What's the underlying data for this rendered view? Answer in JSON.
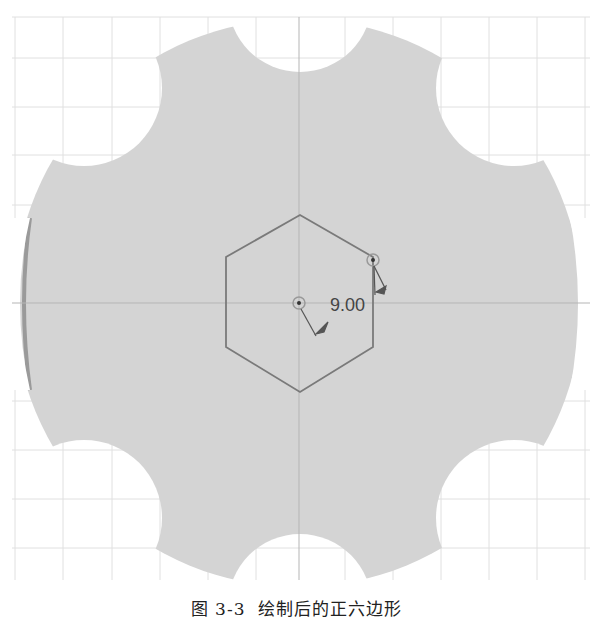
{
  "figure": {
    "caption": "图 3-3  绘制后的正六边形",
    "caption_clipped": true
  },
  "sketch": {
    "dimension_label": "9.00",
    "shape": "disc with 8 arc notches (gear-like plate)",
    "inner_shape": "regular hexagon",
    "colors": {
      "background": "#ffffff",
      "grid": "#dedede",
      "axis": "#b5b5b5",
      "fill": "#d4d4d4",
      "edge_highlight": "#9a9a9a",
      "sketch_line": "#7a7a7a",
      "dimension_text": "#444444"
    }
  }
}
